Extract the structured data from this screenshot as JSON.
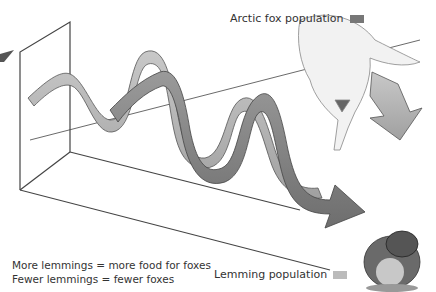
{
  "legend": {
    "fox": {
      "label": "Arctic fox population",
      "color": "#777777"
    },
    "lemming": {
      "label": "Lemming population",
      "color": "#bbbbbb"
    }
  },
  "notes": [
    "More lemmings = more food for foxes",
    "Fewer lemmings = fewer foxes"
  ],
  "illustrations": [
    "arctic-fox",
    "lemming"
  ],
  "colors": {
    "fox_ribbon": "#8a8a8a",
    "lemming_ribbon": "#b5b5b5",
    "axes": "#444444"
  }
}
